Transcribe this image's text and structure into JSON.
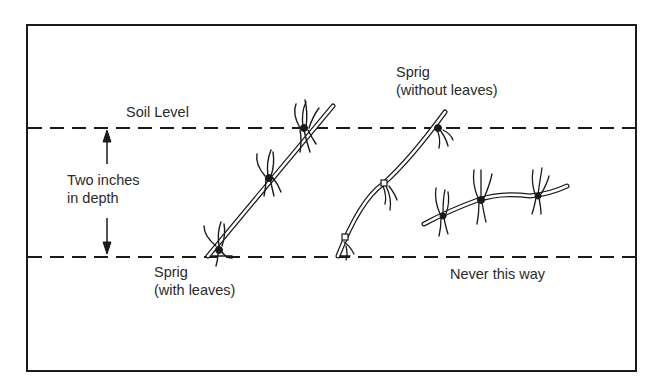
{
  "diagram": {
    "labels": {
      "soil_level": "Soil Level",
      "depth_line1": "Two inches",
      "depth_line2": "in depth",
      "sprig_without_line1": "Sprig",
      "sprig_without_line2": "(without leaves)",
      "sprig_with_line1": "Sprig",
      "sprig_with_line2": "(with leaves)",
      "never": "Never this way"
    },
    "colors": {
      "ink": "#1a1a1a",
      "background": "#ffffff"
    }
  }
}
